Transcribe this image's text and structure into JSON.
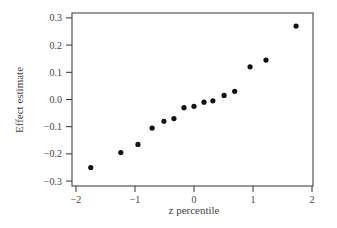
{
  "chart_data": {
    "type": "scatter",
    "title": "",
    "xlabel": "z percentile",
    "ylabel": "Effect estimate",
    "xlim": [
      -2.05,
      2.05
    ],
    "ylim": [
      -0.31,
      0.31
    ],
    "xticks": [
      -2,
      -1,
      0,
      1,
      2
    ],
    "xtick_labels": [
      "−2",
      "−1",
      "0",
      "1",
      "2"
    ],
    "yticks": [
      0.3,
      0.2,
      0.1,
      0.0,
      -0.1,
      -0.2,
      -0.3
    ],
    "ytick_labels": [
      "0.3",
      "0.2",
      "0.1",
      "0.0",
      "−0.1",
      "−0.2",
      "−0.3"
    ],
    "grid": false,
    "legend": null,
    "points": [
      {
        "x": -1.75,
        "y": -0.25
      },
      {
        "x": -1.24,
        "y": -0.195
      },
      {
        "x": -0.95,
        "y": -0.165
      },
      {
        "x": -0.71,
        "y": -0.105
      },
      {
        "x": -0.51,
        "y": -0.08
      },
      {
        "x": -0.34,
        "y": -0.07
      },
      {
        "x": -0.17,
        "y": -0.03
      },
      {
        "x": 0.0,
        "y": -0.025
      },
      {
        "x": 0.17,
        "y": -0.01
      },
      {
        "x": 0.32,
        "y": -0.005
      },
      {
        "x": 0.51,
        "y": 0.015
      },
      {
        "x": 0.69,
        "y": 0.03
      },
      {
        "x": 0.95,
        "y": 0.12
      },
      {
        "x": 1.22,
        "y": 0.145
      },
      {
        "x": 1.73,
        "y": 0.27
      }
    ]
  }
}
